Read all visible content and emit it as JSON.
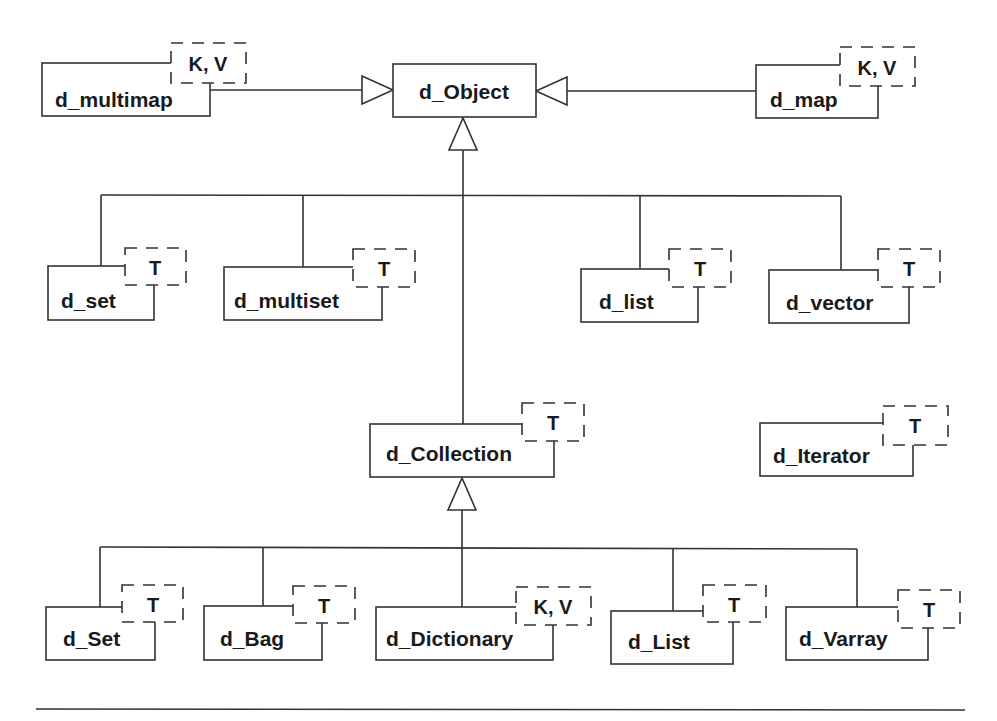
{
  "diagram": {
    "type": "UML class hierarchy",
    "root": "d_Object",
    "classes": {
      "d_Object": {
        "label": "d_Object",
        "params": ""
      },
      "d_multimap": {
        "label": "d_multimap",
        "params": "K, V"
      },
      "d_map": {
        "label": "d_map",
        "params": "K, V"
      },
      "d_set": {
        "label": "d_set",
        "params": "T"
      },
      "d_multiset": {
        "label": "d_multiset",
        "params": "T"
      },
      "d_list": {
        "label": "d_list",
        "params": "T"
      },
      "d_vector": {
        "label": "d_vector",
        "params": "T"
      },
      "d_Collection": {
        "label": "d_Collection",
        "params": "T"
      },
      "d_Iterator": {
        "label": "d_Iterator",
        "params": "T"
      },
      "d_Set": {
        "label": "d_Set",
        "params": "T"
      },
      "d_Bag": {
        "label": "d_Bag",
        "params": "T"
      },
      "d_Dictionary": {
        "label": "d_Dictionary",
        "params": "K, V"
      },
      "d_List": {
        "label": "d_List",
        "params": "T"
      },
      "d_Varray": {
        "label": "d_Varray",
        "params": "T"
      }
    },
    "generalizations": [
      {
        "child": "d_multimap",
        "parent": "d_Object"
      },
      {
        "child": "d_map",
        "parent": "d_Object"
      },
      {
        "child": "d_set",
        "parent": "d_Object"
      },
      {
        "child": "d_multiset",
        "parent": "d_Object"
      },
      {
        "child": "d_list",
        "parent": "d_Object"
      },
      {
        "child": "d_vector",
        "parent": "d_Object"
      },
      {
        "child": "d_Collection",
        "parent": "d_Object"
      },
      {
        "child": "d_Set",
        "parent": "d_Collection"
      },
      {
        "child": "d_Bag",
        "parent": "d_Collection"
      },
      {
        "child": "d_Dictionary",
        "parent": "d_Collection"
      },
      {
        "child": "d_List",
        "parent": "d_Collection"
      },
      {
        "child": "d_Varray",
        "parent": "d_Collection"
      }
    ],
    "colors": {
      "stroke": "#333333",
      "text": "#1a1a1a",
      "background": "#ffffff"
    }
  }
}
